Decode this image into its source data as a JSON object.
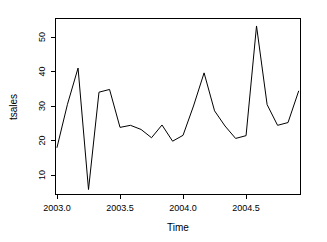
{
  "chart_data": {
    "type": "line",
    "title": "",
    "xlabel": "Time",
    "ylabel": "tsales",
    "xlim": [
      2003.0,
      2004.92
    ],
    "ylim": [
      5.7,
      55.5
    ],
    "grid": false,
    "legend": "none",
    "x_ticks": [
      2003.0,
      2003.5,
      2004.0,
      2004.5
    ],
    "x_tick_labels": [
      "2003.0",
      "2003.5",
      "2004.0",
      "2004.5"
    ],
    "y_ticks": [
      10,
      20,
      30,
      40,
      50
    ],
    "y_tick_labels": [
      "10",
      "20",
      "30",
      "40",
      "50"
    ],
    "series": [
      {
        "name": "tsales",
        "x": [
          2003.0,
          2003.083,
          2003.167,
          2003.25,
          2003.333,
          2003.417,
          2003.5,
          2003.583,
          2003.667,
          2003.75,
          2003.833,
          2003.917,
          2004.0,
          2004.083,
          2004.167,
          2004.25,
          2004.333,
          2004.417,
          2004.5,
          2004.583,
          2004.667,
          2004.75,
          2004.833,
          2004.917
        ],
        "values": [
          18.0,
          30.5,
          41.0,
          5.8,
          34.0,
          34.8,
          23.8,
          24.4,
          23.2,
          20.8,
          24.5,
          19.8,
          21.5,
          30.0,
          39.6,
          28.6,
          24.2,
          20.6,
          21.4,
          53.2,
          30.4,
          24.4,
          25.2,
          34.3
        ]
      }
    ]
  },
  "axis": {
    "x_title": "Time",
    "y_title": "tsales"
  }
}
